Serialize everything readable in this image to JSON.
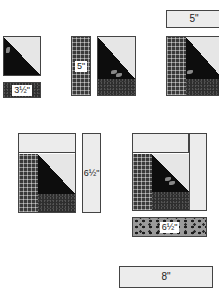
{
  "diagram": {
    "steps": [
      {
        "id": 1,
        "piece_label": "3½\"",
        "description": "Half-square triangle unit with 3½\" strip below"
      },
      {
        "id": 2,
        "piece_label": "5\"",
        "description": "Plaid 5\" strip added to left of unit"
      },
      {
        "id": 3,
        "piece_label": "5\"",
        "description": "5\" light strip added to top"
      },
      {
        "id": 4,
        "piece_label": "6½\"",
        "description": "6½\" light strip added to right"
      },
      {
        "id": 5,
        "piece_label": "6½\"",
        "description": "6½\" dotted strip added to bottom"
      },
      {
        "id": 6,
        "piece_label": "8\"",
        "description": "8\" light strip"
      }
    ],
    "colors": {
      "dark": "#0d0d0d",
      "light": "#ececec",
      "plaid": "#3a3a3a",
      "dots": "#9a9a9a",
      "outline": "#444444"
    }
  }
}
